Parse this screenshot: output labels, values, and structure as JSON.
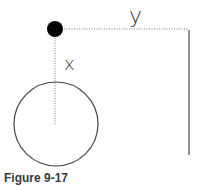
{
  "figure": {
    "caption": "Figure 9-17",
    "labels": {
      "y": "y",
      "x": "x"
    },
    "elements": {
      "point": {
        "cx": 55,
        "cy": 29,
        "r": 8,
        "color": "#000000"
      },
      "horizontal_dotted_line": {
        "x1": 64,
        "y1": 29,
        "x2": 189,
        "y2": 29
      },
      "vertical_dotted_line": {
        "x1": 55,
        "y1": 38,
        "x2": 55,
        "y2": 125
      },
      "vertical_solid_line": {
        "x1": 189,
        "y1": 30,
        "x2": 189,
        "y2": 155
      },
      "circle": {
        "cx": 56,
        "cy": 124,
        "r": 42
      }
    },
    "colors": {
      "stroke": "#444444",
      "dotted": "#777777",
      "text": "#333333"
    }
  }
}
